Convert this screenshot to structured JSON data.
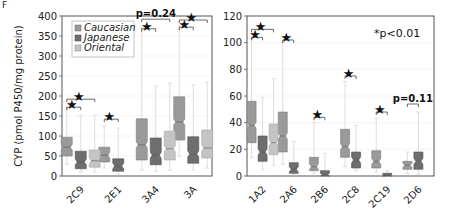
{
  "panel_label": "F",
  "y_axis_label": "CYP (pmol P450/mg protein)",
  "legend": [
    {
      "label": "Caucasian",
      "color": "#9a9a9a"
    },
    {
      "label": "Japanese",
      "color": "#6e6e6e"
    },
    {
      "label": "Oriental",
      "color": "#c4c4c4"
    }
  ],
  "significance_note": "*p<0.01",
  "chart_data": [
    {
      "type": "box",
      "title": "",
      "xlabel": "",
      "ylabel": "CYP (pmol P450/mg protein)",
      "ylim": [
        0,
        400
      ],
      "yticks": [
        0,
        50,
        100,
        150,
        200,
        250,
        300,
        350,
        400
      ],
      "categories": [
        "2C9",
        "2E1",
        "3A4",
        "3A"
      ],
      "legend_position": "upper left",
      "series": [
        {
          "name": "Caucasian",
          "boxes": [
            {
              "cat": "2C9",
              "min": 30,
              "q1": 50,
              "median": 72,
              "q3": 97,
              "max": 170
            },
            {
              "cat": "2E1",
              "min": 20,
              "q1": 35,
              "median": 52,
              "q3": 72,
              "max": 125
            },
            {
              "cat": "3A4",
              "min": 15,
              "q1": 40,
              "median": 78,
              "q3": 143,
              "max": 370
            },
            {
              "cat": "3A",
              "min": 50,
              "q1": 90,
              "median": 135,
              "q3": 198,
              "max": 375
            }
          ]
        },
        {
          "name": "Japanese",
          "boxes": [
            {
              "cat": "2C9",
              "min": 10,
              "q1": 18,
              "median": 35,
              "q3": 62,
              "max": 152
            },
            {
              "cat": "2E1",
              "min": 5,
              "q1": 12,
              "median": 25,
              "q3": 43,
              "max": 120
            },
            {
              "cat": "3A4",
              "min": 12,
              "q1": 28,
              "median": 52,
              "q3": 95,
              "max": 225
            },
            {
              "cat": "3A",
              "min": 15,
              "q1": 32,
              "median": 55,
              "q3": 98,
              "max": 228
            }
          ]
        },
        {
          "name": "Oriental",
          "boxes": [
            {
              "cat": "2C9",
              "min": 10,
              "q1": 22,
              "median": 38,
              "q3": 65,
              "max": 152
            },
            {
              "cat": "3A4",
              "min": 15,
              "q1": 40,
              "median": 68,
              "q3": 112,
              "max": 232
            },
            {
              "cat": "3A",
              "min": 20,
              "q1": 45,
              "median": 70,
              "q3": 115,
              "max": 235
            }
          ]
        }
      ],
      "annotations": [
        {
          "text": "*",
          "cat": "2C9",
          "pair": "Caucasian-Japanese",
          "y": 172
        },
        {
          "text": "*",
          "cat": "2C9",
          "pair": "Caucasian-Oriental",
          "y": 192
        },
        {
          "text": "*",
          "cat": "2E1",
          "pair": "Caucasian-Japanese",
          "y": 142
        },
        {
          "text": "*",
          "cat": "3A4",
          "pair": "Caucasian-Japanese",
          "y": 368
        },
        {
          "text": "p=0.24",
          "cat": "3A4",
          "pair": "Caucasian-Oriental",
          "y": 392
        },
        {
          "text": "*",
          "cat": "3A",
          "pair": "Caucasian-Japanese",
          "y": 372
        },
        {
          "text": "*",
          "cat": "3A",
          "pair": "Caucasian-Oriental",
          "y": 390
        }
      ]
    },
    {
      "type": "box",
      "title": "",
      "xlabel": "",
      "ylabel": "",
      "ylim": [
        0,
        120
      ],
      "yticks": [
        0,
        20,
        40,
        60,
        80,
        100,
        120
      ],
      "categories": [
        "1A2",
        "2A6",
        "2B6",
        "2C8",
        "2C19",
        "2D6"
      ],
      "series": [
        {
          "name": "Caucasian",
          "boxes": [
            {
              "cat": "1A2",
              "min": 14,
              "q1": 25,
              "median": 38,
              "q3": 56,
              "max": 103
            },
            {
              "cat": "2A6",
              "min": 9,
              "q1": 18,
              "median": 30,
              "q3": 48,
              "max": 100
            },
            {
              "cat": "2B6",
              "min": 2,
              "q1": 4,
              "median": 7,
              "q3": 14,
              "max": 40
            },
            {
              "cat": "2C8",
              "min": 7,
              "q1": 14,
              "median": 22,
              "q3": 35,
              "max": 71
            },
            {
              "cat": "2C19",
              "min": 3,
              "q1": 6,
              "median": 11,
              "q3": 19,
              "max": 43
            },
            {
              "cat": "2D6",
              "min": 2,
              "q1": 5,
              "median": 8,
              "q3": 11,
              "max": 18
            }
          ]
        },
        {
          "name": "Japanese",
          "boxes": [
            {
              "cat": "1A2",
              "min": 5,
              "q1": 11,
              "median": 18,
              "q3": 30,
              "max": 59
            },
            {
              "cat": "2A6",
              "min": 1,
              "q1": 2,
              "median": 5,
              "q3": 10,
              "max": 26
            },
            {
              "cat": "2B6",
              "min": 0,
              "q1": 0,
              "median": 1,
              "q3": 4,
              "max": 17
            },
            {
              "cat": "2C8",
              "min": 4,
              "q1": 6,
              "median": 12,
              "q3": 18,
              "max": 38
            },
            {
              "cat": "2C19",
              "min": 0,
              "q1": 0,
              "median": 0.5,
              "q3": 2,
              "max": 4
            },
            {
              "cat": "2D6",
              "min": 1,
              "q1": 5,
              "median": 11,
              "q3": 18,
              "max": 48
            }
          ]
        },
        {
          "name": "Oriental",
          "boxes": [
            {
              "cat": "1A2",
              "min": 8,
              "q1": 16,
              "median": 25,
              "q3": 39,
              "max": 73
            }
          ]
        }
      ],
      "annotations": [
        {
          "text": "*",
          "cat": "1A2",
          "pair": "Caucasian-Japanese",
          "y": 104
        },
        {
          "text": "*",
          "cat": "1A2",
          "pair": "Caucasian-Oriental",
          "y": 110
        },
        {
          "text": "*",
          "cat": "2A6",
          "pair": "Caucasian-Japanese",
          "y": 102
        },
        {
          "text": "*",
          "cat": "2B6",
          "pair": "Caucasian-Japanese",
          "y": 44
        },
        {
          "text": "*",
          "cat": "2C8",
          "pair": "Caucasian-Japanese",
          "y": 75
        },
        {
          "text": "*",
          "cat": "2C19",
          "pair": "Caucasian-Japanese",
          "y": 48
        },
        {
          "text": "p=0.11",
          "cat": "2D6",
          "pair": "Caucasian-Japanese",
          "y": 54
        }
      ]
    }
  ]
}
